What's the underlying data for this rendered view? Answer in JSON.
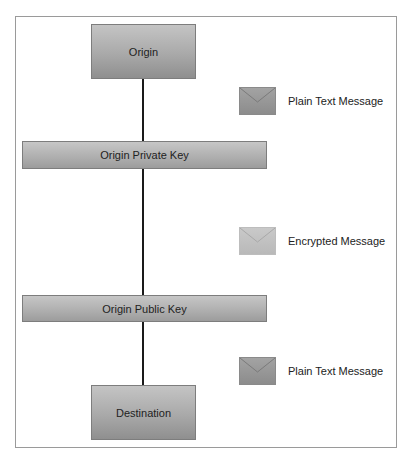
{
  "diagram": {
    "nodes": [
      {
        "id": "origin",
        "label": "Origin"
      },
      {
        "id": "origin-private-key",
        "label": "Origin Private Key"
      },
      {
        "id": "origin-public-key",
        "label": "Origin Public Key"
      },
      {
        "id": "destination",
        "label": "Destination"
      }
    ],
    "messages": [
      {
        "label": "Plain Text Message",
        "icon": "envelope-icon",
        "state": "plain"
      },
      {
        "label": "Encrypted Message",
        "icon": "envelope-icon",
        "state": "encrypted"
      },
      {
        "label": "Plain Text Message",
        "icon": "envelope-icon",
        "state": "plain"
      }
    ],
    "colors": {
      "node_fill": "#a9a9a9",
      "envelope_plain": "#969696",
      "envelope_encrypted": "#c1c1c1",
      "connector": "#1a1a1a",
      "frame_border": "#9a9a9a"
    }
  }
}
